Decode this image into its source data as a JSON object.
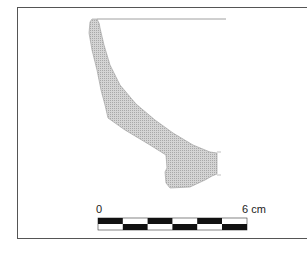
{
  "figure": {
    "fill_color": "#c8c8c8",
    "scale_bar": {
      "start_label": "0",
      "end_label": "6 cm",
      "segments": 6,
      "top_row": [
        "black",
        "white",
        "black",
        "white",
        "black",
        "white"
      ],
      "bottom_row": [
        "white",
        "black",
        "white",
        "black",
        "white",
        "black"
      ]
    }
  }
}
